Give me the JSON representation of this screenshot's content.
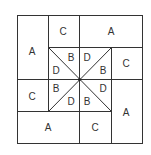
{
  "diagram": {
    "line_color": "#333333",
    "outer_labels": [
      {
        "id": "A1",
        "label": "A",
        "x": 32,
        "y": 51
      },
      {
        "id": "C1",
        "label": "C",
        "x": 63,
        "y": 35
      },
      {
        "id": "A2",
        "label": "A",
        "x": 111,
        "y": 35
      },
      {
        "id": "C2",
        "label": "C",
        "x": 126,
        "y": 67
      },
      {
        "id": "C3",
        "label": "C",
        "x": 32,
        "y": 99
      },
      {
        "id": "A3",
        "label": "A",
        "x": 126,
        "y": 115
      },
      {
        "id": "A4",
        "label": "A",
        "x": 48,
        "y": 131
      },
      {
        "id": "C4",
        "label": "C",
        "x": 95,
        "y": 131
      }
    ],
    "inner_labels": [
      {
        "id": "B1",
        "label": "B",
        "x": 72,
        "y": 60
      },
      {
        "id": "D1",
        "label": "D",
        "x": 87,
        "y": 60
      },
      {
        "id": "D2",
        "label": "D",
        "x": 56,
        "y": 72
      },
      {
        "id": "B2",
        "label": "B",
        "x": 103,
        "y": 72
      },
      {
        "id": "B3",
        "label": "B",
        "x": 56,
        "y": 93
      },
      {
        "id": "D3",
        "label": "D",
        "x": 103,
        "y": 93
      },
      {
        "id": "D4",
        "label": "D",
        "x": 72,
        "y": 104
      },
      {
        "id": "B4",
        "label": "B",
        "x": 87,
        "y": 104
      }
    ]
  }
}
